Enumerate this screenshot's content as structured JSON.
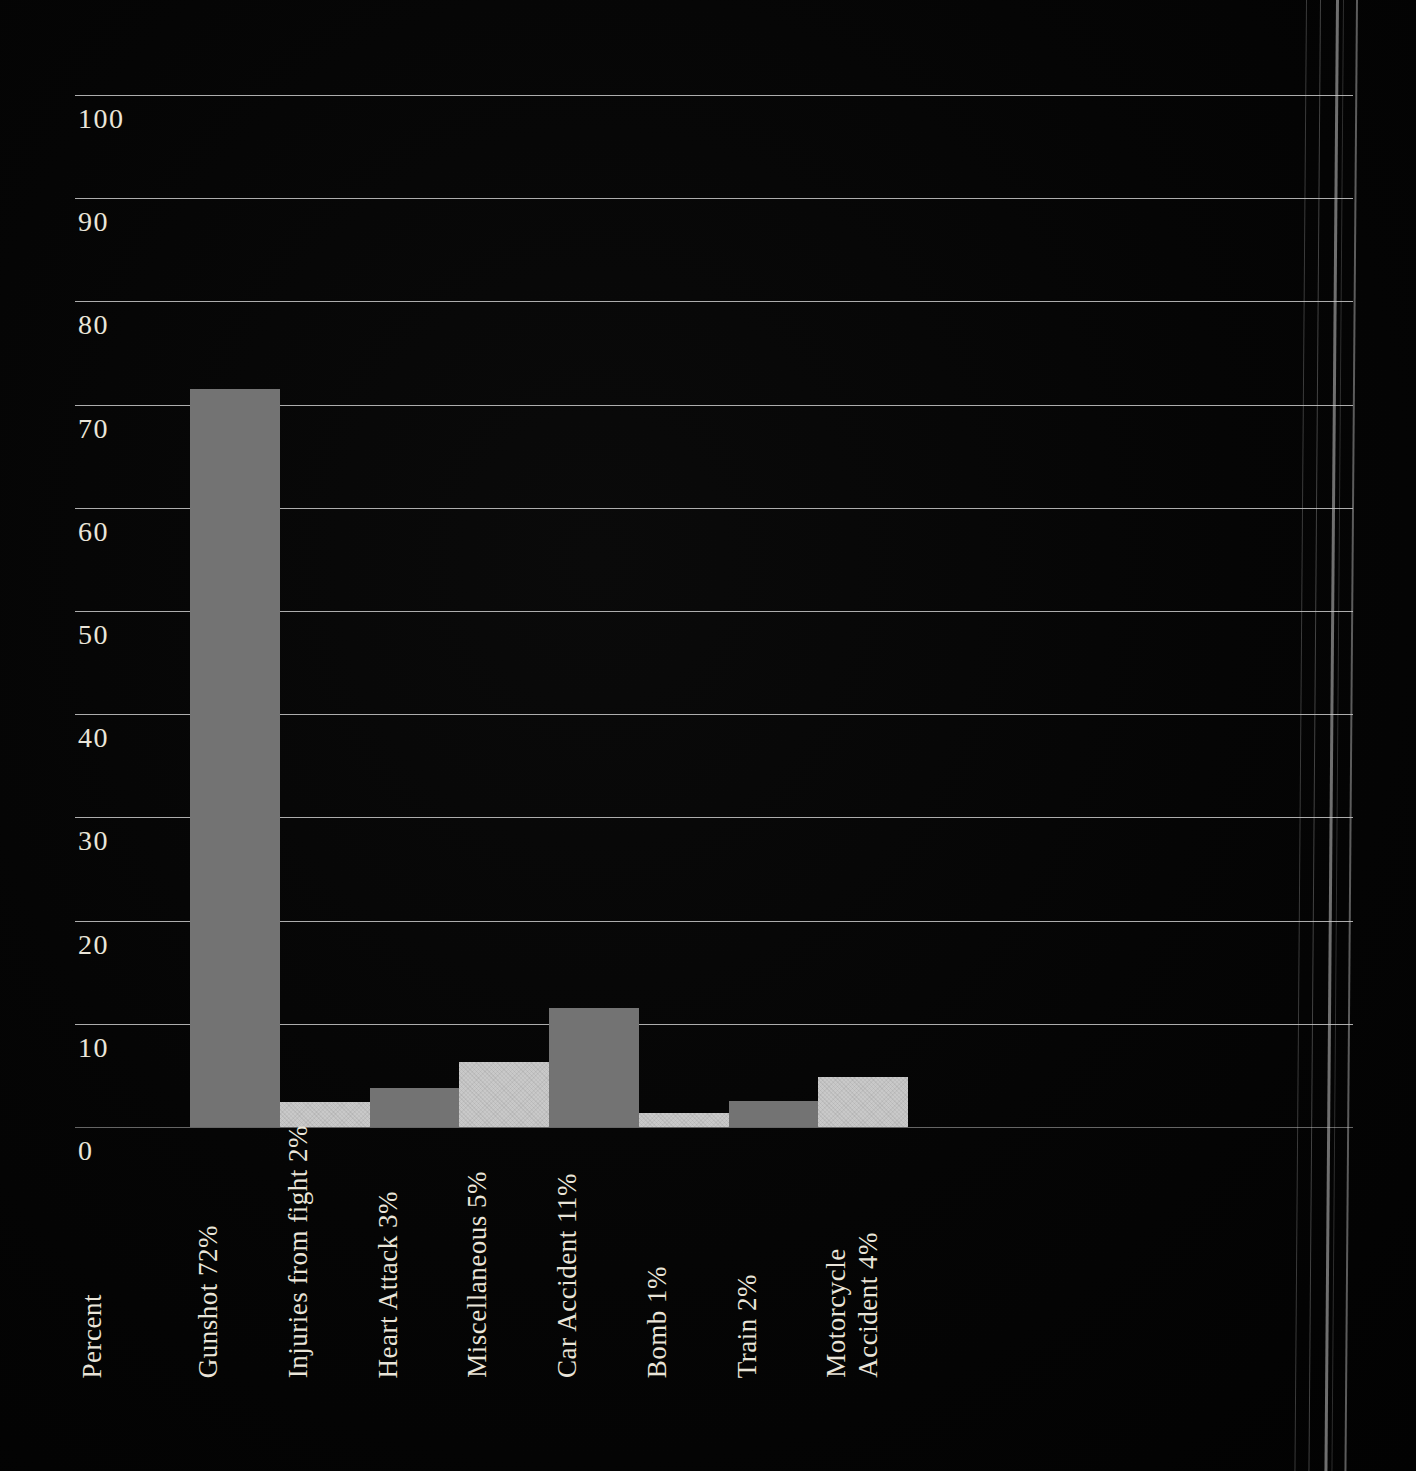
{
  "chart_data": {
    "type": "bar",
    "title": "",
    "ylabel": "Percent",
    "xlabel": "",
    "ylim": [
      0,
      100
    ],
    "y_ticks": [
      0,
      10,
      20,
      30,
      40,
      50,
      60,
      70,
      80,
      90,
      100
    ],
    "grid": "horizontal",
    "legend": "none",
    "categories": [
      {
        "label_lines": [
          "Gunshot 72%"
        ],
        "value": 72,
        "bar_height_pct": 71.5,
        "color_key": "dark"
      },
      {
        "label_lines": [
          "Injuries from fight 2%"
        ],
        "value": 2,
        "bar_height_pct": 2.4,
        "color_key": "light"
      },
      {
        "label_lines": [
          "Heart Attack 3%"
        ],
        "value": 3,
        "bar_height_pct": 3.8,
        "color_key": "dark"
      },
      {
        "label_lines": [
          "Miscellaneous 5%"
        ],
        "value": 5,
        "bar_height_pct": 6.3,
        "color_key": "light"
      },
      {
        "label_lines": [
          "Car Accident 11%"
        ],
        "value": 11,
        "bar_height_pct": 11.5,
        "color_key": "dark"
      },
      {
        "label_lines": [
          "Bomb 1%"
        ],
        "value": 1,
        "bar_height_pct": 1.4,
        "color_key": "light"
      },
      {
        "label_lines": [
          "Train 2%"
        ],
        "value": 2,
        "bar_height_pct": 2.5,
        "color_key": "dark"
      },
      {
        "label_lines": [
          "Motorcycle",
          "Accident 4%"
        ],
        "value": 4,
        "bar_height_pct": 4.8,
        "color_key": "light"
      }
    ],
    "colors": {
      "dark": "#737373",
      "light": "#c9c9c9"
    },
    "gridline_color": "#dcdcdc",
    "text_color": "#eae5d9"
  },
  "decor": {
    "background": "#050505",
    "page_edge_line_color": "#c8c8c8"
  }
}
